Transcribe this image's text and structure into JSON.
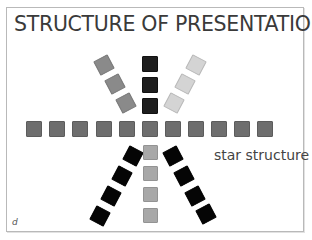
{
  "slide": {
    "title": "STRUCTURE OF PRESENTATION",
    "label": "star structure",
    "corner_letter": "d"
  },
  "colors": {
    "frame_border": "#b9b9b9",
    "horizontal_row": "#6e6e6e",
    "upper_left_arm": "#8a8a8a",
    "upper_center_arm": "#1e1e1e",
    "upper_right_arm": "#d4d4d4",
    "lower_left_arm": "#050505",
    "lower_center_arm": "#a8a8a8",
    "lower_right_arm": "#050505"
  },
  "diagram": {
    "type": "star",
    "horizontal_row_count": 11,
    "upper_left_count": 3,
    "upper_center_count": 3,
    "upper_right_count": 3,
    "lower_left_count": 4,
    "lower_center_count": 4,
    "lower_right_count": 4
  }
}
